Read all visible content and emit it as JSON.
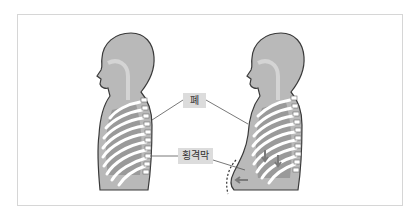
{
  "figure": {
    "labels": {
      "lung": "폐",
      "diaphragm": "횡격막"
    },
    "panels": [
      {
        "name": "exhale-normal",
        "description": "Side view of torso, diaphragm relaxed"
      },
      {
        "name": "inhale-abdominal",
        "description": "Side view of torso, diaphragm contracted, abdomen pushed outward (dashed outline, arrows)"
      }
    ],
    "colors": {
      "body_fill": "#b9b9b9",
      "body_outline": "#3a3a3a",
      "airway": "#d4d4d4",
      "lung_fill": "#9a9a9a",
      "rib": "#ffffff",
      "label_bg": "#dcdcdc",
      "leader_line": "#555555",
      "frame_border": "#d6d6d6"
    }
  }
}
